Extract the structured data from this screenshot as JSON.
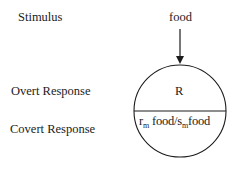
{
  "labels": {
    "stimulus": "Stimulus",
    "overt": "Overt Response",
    "covert": "Covert Response"
  },
  "diagram": {
    "stimulus_value": "food",
    "overt_value": "R",
    "covert_value": {
      "r": "r",
      "r_sub": "m",
      "food1": " food/",
      "s": "s",
      "s_sub": "m",
      "food2": "food"
    }
  }
}
